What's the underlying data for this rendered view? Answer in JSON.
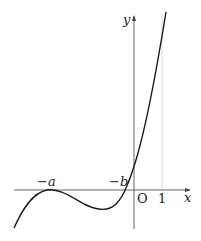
{
  "diagram": {
    "type": "function-graph",
    "axes": {
      "x_label": "x",
      "y_label": "y",
      "origin_label": "O"
    },
    "ticks": {
      "neg_a": "−a",
      "neg_b": "−b",
      "one": "1"
    },
    "colors": {
      "curve": "#1a1a1a",
      "axis": "#555555",
      "guide": "#bbbbbb"
    }
  }
}
